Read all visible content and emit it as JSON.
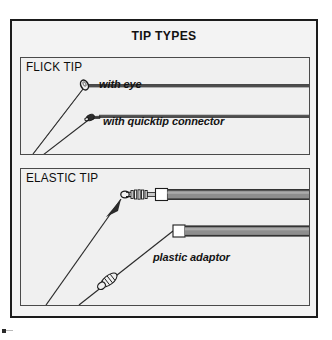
{
  "figure": {
    "title": "TIP TYPES",
    "background_color": "#f3f3f3",
    "frame_color": "#1b1b1b",
    "panel_fill": "#f0f0f0",
    "rod_dark_color": "#4d4d4d",
    "rod_gray_color": "#8e8e8e",
    "line_color": "#2b2b2b"
  },
  "panels": [
    {
      "id": "flick-tip",
      "label": "FLICK TIP",
      "annotations": [
        {
          "id": "with-eye",
          "text": "with eye"
        },
        {
          "id": "with-quicktip-connector",
          "text": "with quicktip connector"
        }
      ],
      "items": [
        {
          "name": "flick-tip-with-eye",
          "tip_feature": "eye"
        },
        {
          "name": "flick-tip-with-quicktip-connector",
          "tip_feature": "quicktip connector"
        }
      ]
    },
    {
      "id": "elastic-tip",
      "label": "ELASTIC TIP",
      "annotations": [
        {
          "id": "plastic-adaptor",
          "text": "plastic adaptor"
        }
      ],
      "items": [
        {
          "name": "elastic-tip-with-connector",
          "tip_feature": "ring and coil connector"
        },
        {
          "name": "elastic-tip-with-plastic-adaptor",
          "tip_feature": "plastic adaptor"
        }
      ]
    }
  ]
}
